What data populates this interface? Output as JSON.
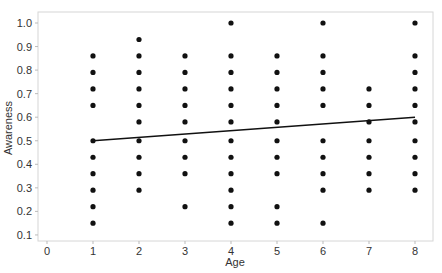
{
  "chart_data": {
    "type": "scatter",
    "title": "",
    "xlabel": "Age",
    "ylabel": "Awareness",
    "xlim": [
      -0.3,
      8.3
    ],
    "ylim": [
      0.09,
      1.03
    ],
    "xticks": [
      0,
      1,
      2,
      3,
      4,
      5,
      6,
      7,
      8
    ],
    "yticks": [
      0.1,
      0.2,
      0.3,
      0.4,
      0.5,
      0.6,
      0.7,
      0.8,
      0.9,
      1.0
    ],
    "ytick_labels": [
      "0.1",
      "0.2",
      "0.3",
      "0.4",
      "0.5",
      "0.6",
      "0.7",
      "0.8",
      "0.9",
      "1.0"
    ],
    "grid": false,
    "legend": null,
    "series": [
      {
        "name": "observations",
        "marker": "circle",
        "color": "#111111",
        "points": [
          [
            1,
            0.86
          ],
          [
            1,
            0.79
          ],
          [
            1,
            0.72
          ],
          [
            1,
            0.65
          ],
          [
            1,
            0.5
          ],
          [
            1,
            0.43
          ],
          [
            1,
            0.36
          ],
          [
            1,
            0.29
          ],
          [
            1,
            0.22
          ],
          [
            1,
            0.15
          ],
          [
            2,
            0.93
          ],
          [
            2,
            0.86
          ],
          [
            2,
            0.79
          ],
          [
            2,
            0.72
          ],
          [
            2,
            0.65
          ],
          [
            2,
            0.58
          ],
          [
            2,
            0.5
          ],
          [
            2,
            0.43
          ],
          [
            2,
            0.36
          ],
          [
            2,
            0.29
          ],
          [
            3,
            0.86
          ],
          [
            3,
            0.79
          ],
          [
            3,
            0.72
          ],
          [
            3,
            0.65
          ],
          [
            3,
            0.58
          ],
          [
            3,
            0.5
          ],
          [
            3,
            0.43
          ],
          [
            3,
            0.36
          ],
          [
            3,
            0.22
          ],
          [
            4,
            1.0
          ],
          [
            4,
            0.86
          ],
          [
            4,
            0.79
          ],
          [
            4,
            0.72
          ],
          [
            4,
            0.65
          ],
          [
            4,
            0.58
          ],
          [
            4,
            0.5
          ],
          [
            4,
            0.43
          ],
          [
            4,
            0.36
          ],
          [
            4,
            0.29
          ],
          [
            4,
            0.22
          ],
          [
            4,
            0.15
          ],
          [
            5,
            0.86
          ],
          [
            5,
            0.79
          ],
          [
            5,
            0.72
          ],
          [
            5,
            0.65
          ],
          [
            5,
            0.58
          ],
          [
            5,
            0.5
          ],
          [
            5,
            0.43
          ],
          [
            5,
            0.36
          ],
          [
            5,
            0.22
          ],
          [
            5,
            0.15
          ],
          [
            6,
            1.0
          ],
          [
            6,
            0.86
          ],
          [
            6,
            0.79
          ],
          [
            6,
            0.72
          ],
          [
            6,
            0.65
          ],
          [
            6,
            0.5
          ],
          [
            6,
            0.43
          ],
          [
            6,
            0.36
          ],
          [
            6,
            0.29
          ],
          [
            6,
            0.15
          ],
          [
            7,
            0.72
          ],
          [
            7,
            0.65
          ],
          [
            7,
            0.58
          ],
          [
            7,
            0.5
          ],
          [
            7,
            0.43
          ],
          [
            7,
            0.36
          ],
          [
            7,
            0.29
          ],
          [
            8,
            1.0
          ],
          [
            8,
            0.86
          ],
          [
            8,
            0.79
          ],
          [
            8,
            0.72
          ],
          [
            8,
            0.65
          ],
          [
            8,
            0.58
          ],
          [
            8,
            0.5
          ],
          [
            8,
            0.43
          ],
          [
            8,
            0.36
          ],
          [
            8,
            0.29
          ]
        ]
      },
      {
        "name": "linear fit",
        "type": "line",
        "color": "#111111",
        "points": [
          [
            1,
            0.5
          ],
          [
            8,
            0.6
          ]
        ]
      }
    ]
  }
}
